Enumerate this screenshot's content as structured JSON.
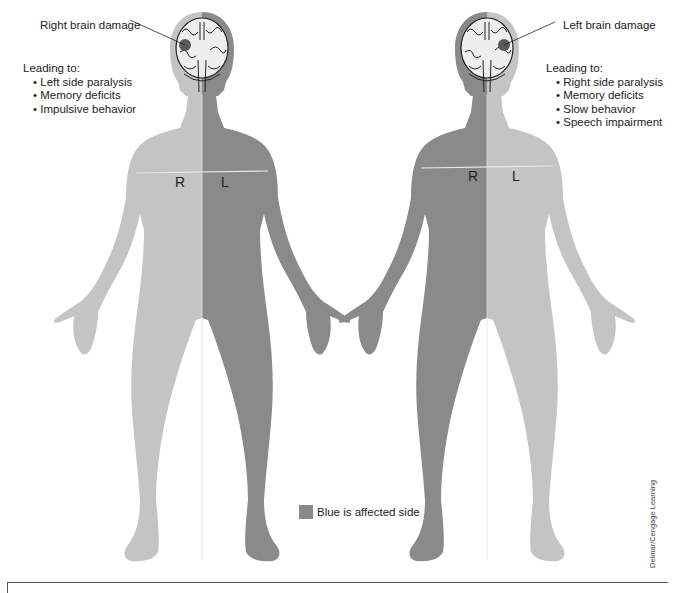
{
  "colors": {
    "affected": "#8a8a8a",
    "unaffected": "#c4c4c4",
    "brain_fill": "#eeeeee",
    "lesion": "#5a5a5a",
    "divider": "#e8e8e8"
  },
  "left_figure": {
    "damage_label": "Right brain damage",
    "leading_to": "Leading to:",
    "effects": [
      "Left side paralysis",
      "Memory deficits",
      "Impulsive behavior"
    ],
    "side_labels": {
      "right": "R",
      "left": "L"
    },
    "affected_side": "L"
  },
  "right_figure": {
    "damage_label": "Left brain damage",
    "leading_to": "Leading to:",
    "effects": [
      "Right side paralysis",
      "Memory deficits",
      "Slow behavior",
      "Speech impairment"
    ],
    "side_labels": {
      "right": "R",
      "left": "L"
    },
    "affected_side": "R"
  },
  "legend": {
    "label": "Blue is affected side"
  },
  "credit": "Delmar/Cengage Learning"
}
